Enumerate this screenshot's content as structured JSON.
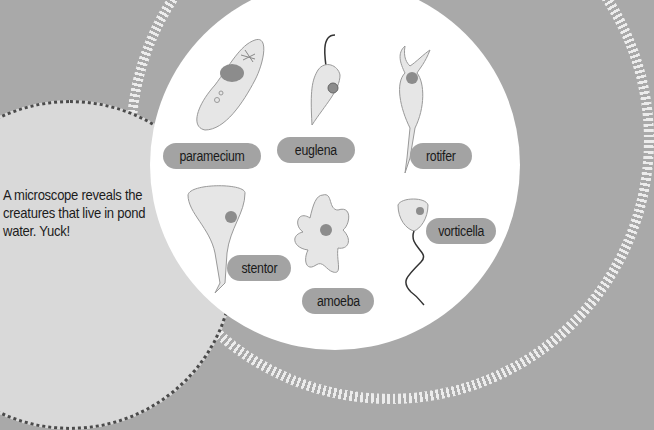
{
  "caption": "A microscope reveals the creatures that live in pond water. Yuck!",
  "organisms": [
    {
      "name": "paramecium"
    },
    {
      "name": "euglena"
    },
    {
      "name": "rotifer"
    },
    {
      "name": "stentor"
    },
    {
      "name": "amoeba"
    },
    {
      "name": "vorticella"
    }
  ],
  "colors": {
    "background": "#a9a9a9",
    "bubble": "#d9d9d9",
    "lens": "#ffffff",
    "label": "#a3a3a3",
    "organism_fill": "#e6e6e6",
    "nucleus": "#8c8c8c"
  }
}
